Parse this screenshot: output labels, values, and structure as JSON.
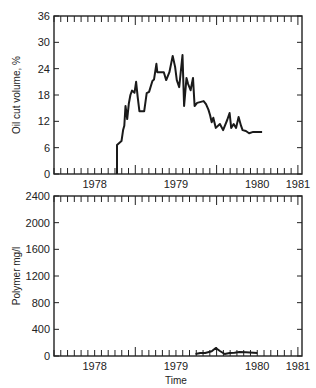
{
  "chart_data": [
    {
      "type": "line",
      "title": "",
      "xlabel": "",
      "ylabel": "Oil cut volume, %",
      "xlim": [
        1978.0,
        1981.05
      ],
      "ylim": [
        0,
        36
      ],
      "yticks": [
        0,
        6,
        12,
        18,
        24,
        30,
        36
      ],
      "xtick_labels": [
        "1978",
        "1979",
        "1980",
        "1981"
      ],
      "grid": false,
      "series": [
        {
          "name": "Oil cut",
          "x": [
            1978.775,
            1978.775,
            1978.83,
            1978.85,
            1978.865,
            1978.88,
            1978.9,
            1978.92,
            1978.94,
            1978.96,
            1978.99,
            1979.01,
            1979.03,
            1979.05,
            1979.07,
            1979.11,
            1979.14,
            1979.17,
            1979.21,
            1979.23,
            1979.26,
            1979.27,
            1979.28,
            1979.35,
            1979.38,
            1979.42,
            1979.46,
            1979.49,
            1979.51,
            1979.54,
            1979.58,
            1979.6,
            1979.63,
            1979.65,
            1979.68,
            1979.71,
            1979.73,
            1979.76,
            1979.84,
            1979.87,
            1979.9,
            1979.92,
            1979.94,
            1979.96,
            1979.99,
            1980.04,
            1980.08,
            1980.13,
            1980.16,
            1980.18,
            1980.21,
            1980.24,
            1980.27,
            1980.3,
            1980.32,
            1980.36,
            1980.4,
            1980.45,
            1980.5,
            1980.56
          ],
          "y": [
            0,
            6.6,
            7.5,
            10.0,
            11.0,
            15.5,
            12.5,
            16.0,
            18.0,
            19.0,
            18.5,
            21.0,
            17.5,
            14.3,
            14.3,
            14.3,
            18.4,
            18.7,
            21.2,
            21.5,
            25.1,
            23.2,
            23.2,
            23.2,
            21.4,
            23.2,
            26.9,
            24.4,
            21.4,
            19.8,
            27.1,
            15.5,
            21.9,
            20.5,
            19.1,
            21.9,
            15.5,
            16.2,
            16.6,
            15.9,
            14.6,
            13.4,
            11.8,
            12.8,
            10.5,
            11.4,
            10.0,
            12.3,
            13.9,
            10.5,
            11.4,
            10.5,
            13.0,
            11.0,
            10.0,
            9.8,
            9.3,
            9.6,
            9.6,
            9.6
          ]
        }
      ]
    },
    {
      "type": "line",
      "title": "",
      "xlabel": "Time",
      "ylabel": "Polymer mg/l",
      "xlim": [
        1978.0,
        1981.05
      ],
      "ylim": [
        0,
        2400
      ],
      "yticks": [
        0,
        400,
        800,
        1200,
        1600,
        2000,
        2400
      ],
      "xtick_labels": [
        "1978",
        "1979",
        "1980",
        "1981"
      ],
      "grid": false,
      "series": [
        {
          "name": "Polymer",
          "x": [
            1979.74,
            1979.8,
            1979.86,
            1979.94,
            1979.99,
            1980.04,
            1980.1,
            1980.16,
            1980.22,
            1980.28,
            1980.36,
            1980.5
          ],
          "y": [
            30,
            45,
            45,
            70,
            120,
            75,
            30,
            45,
            50,
            60,
            55,
            45
          ]
        }
      ]
    }
  ],
  "plots": {
    "top": {
      "ylabel": "Oil cut volume, %",
      "yticks": [
        "0",
        "6",
        "12",
        "18",
        "24",
        "30",
        "36"
      ]
    },
    "bottom": {
      "ylabel": "Polymer mg/l",
      "yticks": [
        "0",
        "400",
        "800",
        "1200",
        "1600",
        "2000",
        "2400"
      ],
      "xlabel": "Time"
    },
    "xtick_labels": [
      "1978",
      "1979",
      "1980",
      "1981"
    ]
  },
  "colors": {
    "line": "#1a1a1a",
    "axis": "#222222",
    "background": "#ffffff"
  }
}
